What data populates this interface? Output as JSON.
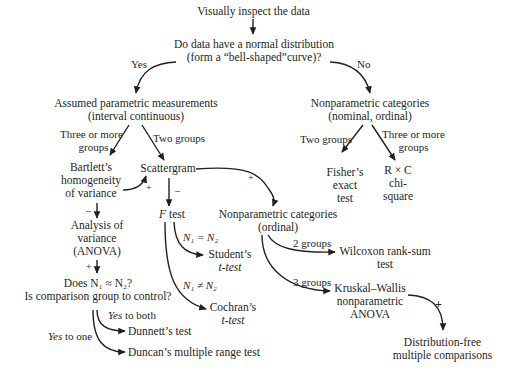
{
  "nodes": {
    "start": "Visually inspect the data",
    "normal_q": [
      "Do data have a normal distribution",
      "(form a “bell-shaped”curve)?"
    ],
    "parametric": [
      "Assumed parametric measurements",
      "(interval continuous)"
    ],
    "nonparam_nominal": [
      "Nonparametric categories",
      "(nominal, ordinal)"
    ],
    "bartlett": [
      "Bartlett’s",
      "homogeneity",
      "of variance"
    ],
    "scattergram": "Scattergram",
    "fisher": [
      "Fisher’s",
      "exact",
      "test"
    ],
    "rxc": [
      "R × C",
      "chi-",
      "square"
    ],
    "anova": [
      "Analysis of",
      "variance",
      "(ANOVA)"
    ],
    "f_test": {
      "italic": "F",
      "rest": " test"
    },
    "nonparam_ordinal": [
      "Nonparametric categories",
      "(ordinal)"
    ],
    "students": [
      "Student’s",
      "t-test"
    ],
    "cochrans": [
      "Cochran’s",
      "t-test"
    ],
    "wilcoxon": [
      "Wilcoxon rank-sum",
      "test"
    ],
    "kruskal": [
      "Kruskal–Wallis",
      "nonparametric",
      "ANOVA"
    ],
    "does_n": [
      "Does N₁ ≈ N₂?",
      "Is comparison group to control?"
    ],
    "dunnett": "Dunnett’s test",
    "duncan": "Duncan’s multiple range test",
    "distfree": [
      "Distribution-free",
      "multiple comparisons"
    ]
  },
  "edge_labels": {
    "yes": "Yes",
    "no": "No",
    "three_more_left": [
      "Three or more",
      "groups"
    ],
    "two_groups_left": "Two groups",
    "two_groups_right": "Two groups",
    "three_more_right": [
      "Three or more",
      "groups"
    ],
    "n_equal": "N₁ = N₂",
    "n_not_equal": "N₁ ≠ N₂",
    "two_groups_ord": "2 groups",
    "three_groups_ord": "3 groups",
    "yes_both": {
      "italic": "Yes",
      "rest": " to both"
    },
    "yes_one": {
      "italic": "Yes",
      "rest": " to one"
    }
  },
  "signs": {
    "plus": "+",
    "minus": "–"
  }
}
